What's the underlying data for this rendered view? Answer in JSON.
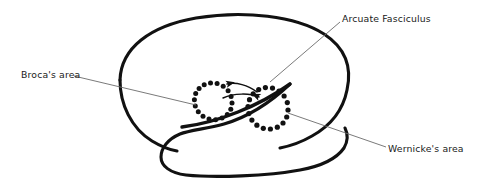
{
  "figure": {
    "kind": "anatomical-diagram",
    "background_color": "#ffffff",
    "outline_color": "#111111",
    "leader_line_color": "#6b6b6b",
    "dotted_region_color": "#111111"
  },
  "labels": {
    "arcuate_fasciculus": "Arcuate Fasciculus",
    "brocas_area": "Broca's area",
    "wernickes_area": "Wernicke's area"
  },
  "regions": [
    {
      "id": "brocas-area",
      "name": "Broca's area",
      "marker": "dotted-ellipse",
      "center": [
        213,
        103
      ],
      "radius": [
        19,
        17
      ],
      "dot_count": 17
    },
    {
      "id": "wernickes-area",
      "name": "Wernicke's area",
      "marker": "dotted-ellipse",
      "center": [
        268,
        110
      ],
      "radius": [
        20,
        19
      ],
      "dot_count": 17
    }
  ],
  "connectors": [
    {
      "id": "arcuate-arrow-to-broca",
      "name": "arcuate fasciculus arrow pointing toward Broca's area",
      "direction": "right-to-left",
      "arrowhead_at": [
        224,
        85
      ]
    },
    {
      "id": "arcuate-arrow-to-wernicke",
      "name": "arcuate fasciculus arrow pointing toward Wernicke's area",
      "direction": "left-to-right",
      "arrowhead_at": [
        262,
        97
      ]
    }
  ],
  "leader_lines": [
    {
      "id": "leader-arcuate",
      "from": [
        340,
        22
      ],
      "to": [
        270,
        82
      ]
    },
    {
      "id": "leader-broca",
      "from": [
        74,
        76
      ],
      "to": [
        196,
        105
      ]
    },
    {
      "id": "leader-wernicke",
      "from": [
        288,
        113
      ],
      "to": [
        386,
        147
      ]
    }
  ]
}
